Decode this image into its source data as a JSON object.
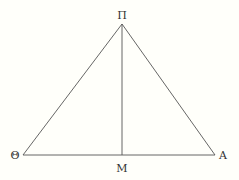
{
  "figure": {
    "type": "triangle-with-median",
    "background": "#fffffa",
    "line_color": "#555555",
    "points": {
      "apex": {
        "label": "Π",
        "x": 122,
        "y": 24
      },
      "left": {
        "label": "Θ",
        "x": 23,
        "y": 155
      },
      "right": {
        "label": "A",
        "x": 215,
        "y": 155
      },
      "foot": {
        "label": "M",
        "x": 122,
        "y": 155
      }
    },
    "segments": [
      {
        "from": "Π",
        "to": "Θ"
      },
      {
        "from": "Π",
        "to": "A"
      },
      {
        "from": "Θ",
        "to": "A"
      },
      {
        "from": "Π",
        "to": "M"
      }
    ]
  }
}
